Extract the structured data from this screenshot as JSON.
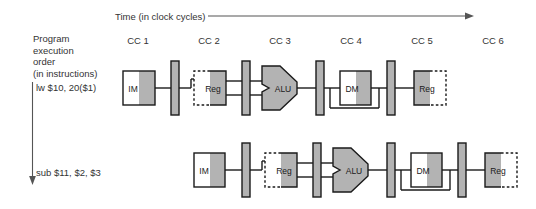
{
  "diagram": {
    "title_axis": "Time (in clock cycles)",
    "y_axis_label": "Program\nexecution\norder\n(in instructions)",
    "y_axis_lines": [
      "Program",
      "execution",
      "order",
      "(in instructions)"
    ],
    "clock_cycles": [
      "CC 1",
      "CC 2",
      "CC 3",
      "CC 4",
      "CC 5",
      "CC 6"
    ],
    "instructions": [
      {
        "text": "lw $10, 20($1)",
        "stages": [
          "IM",
          "Reg",
          "ALU",
          "DM",
          "Reg"
        ]
      },
      {
        "text": "sub $11, $2, $3",
        "stages": [
          "IM",
          "Reg",
          "ALU",
          "DM",
          "Reg"
        ]
      }
    ],
    "stage_labels": {
      "im": "IM",
      "reg": "Reg",
      "alu": "ALU",
      "dm": "DM"
    },
    "colors": {
      "fill_gray": "#b3b3b3",
      "fill_white": "#ffffff",
      "stroke_dark": "#1a1a1a",
      "text": "#333333",
      "arrow": "#555555"
    }
  }
}
